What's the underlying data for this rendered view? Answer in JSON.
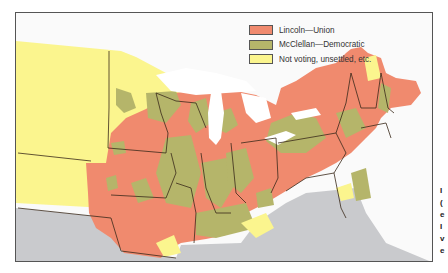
{
  "map": {
    "title": "",
    "colors": {
      "lincoln": "#F08A6E",
      "mcclellan": "#B5B56A",
      "not_voting": "#FBF58E",
      "water": "#ffffff",
      "southern_states": "#C9CACD",
      "background": "#fafafa",
      "border": "#3a2a1a"
    }
  },
  "legend": {
    "items": [
      {
        "label": "Lincoln—Union",
        "color": "#F08A6E"
      },
      {
        "label": "McClellan—Democratic",
        "color": "#B5B56A"
      },
      {
        "label": "Not voting, unsettled, etc.",
        "color": "#FBF58E"
      }
    ]
  },
  "caption_fragment": [
    "I",
    "(",
    "e",
    "I",
    "v",
    "e"
  ]
}
